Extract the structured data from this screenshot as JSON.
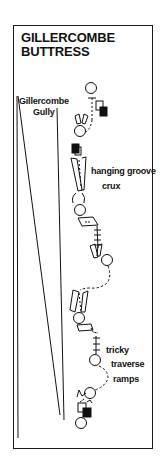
{
  "diagram": {
    "title_line1": "GILLERCOMBE",
    "title_line2": "BUTTRESS",
    "labels": {
      "gully_line1": "Gillercombe",
      "gully_line2": "Gully",
      "hanging_groove": "hanging groove",
      "crux": "crux",
      "tricky": "tricky",
      "traverse": "traverse",
      "ramps": "ramps"
    },
    "colors": {
      "ink": "#111111",
      "background": "#ffffff"
    },
    "legend_symbols": [
      "belay-circle",
      "chockstone-square",
      "block-square-filled",
      "groove",
      "slab",
      "steps-ladder"
    ]
  }
}
